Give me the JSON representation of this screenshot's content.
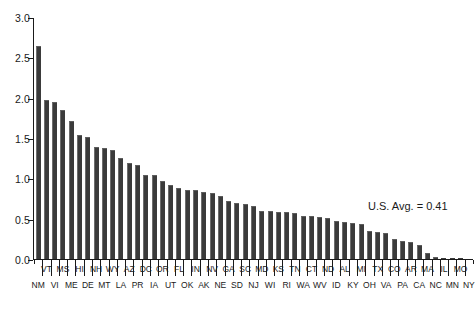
{
  "chart_data": {
    "type": "bar",
    "title": "",
    "subtitle": "",
    "xlabel": "",
    "ylabel": "",
    "ylim": [
      0.0,
      3.0
    ],
    "ytick_values": [
      0.0,
      0.5,
      1.0,
      1.5,
      2.0,
      2.5,
      3.0
    ],
    "ytick_labels": [
      "0.0",
      "0.5",
      "1.0",
      "1.5",
      "2.0",
      "2.5",
      "3.0"
    ],
    "grid": false,
    "legend": null,
    "legend_position": "none",
    "bar_color": "#3b3b3b",
    "axis_color": "#1a1a1a",
    "background_color": "#ffffff",
    "label_layout": "staggered-two-row",
    "categories": [
      "NM",
      "VT",
      "VI",
      "MS",
      "ME",
      "HI",
      "DE",
      "NH",
      "MT",
      "WY",
      "LA",
      "AZ",
      "PR",
      "DC",
      "IA",
      "OR",
      "UT",
      "FL",
      "OK",
      "IN",
      "AK",
      "NV",
      "NE",
      "GA",
      "SD",
      "SC",
      "NJ",
      "MD",
      "WI",
      "KS",
      "RI",
      "TN",
      "WA",
      "CT",
      "WV",
      "ND",
      "ID",
      "AL",
      "KY",
      "MI",
      "OH",
      "TX",
      "VA",
      "CO",
      "PA",
      "AR",
      "CA",
      "MA",
      "NC",
      "IL",
      "MN",
      "MO",
      "NY"
    ],
    "values": [
      2.65,
      1.98,
      1.95,
      1.85,
      1.72,
      1.54,
      1.52,
      1.4,
      1.38,
      1.36,
      1.26,
      1.2,
      1.17,
      1.05,
      1.05,
      0.97,
      0.92,
      0.89,
      0.86,
      0.86,
      0.84,
      0.82,
      0.78,
      0.72,
      0.7,
      0.68,
      0.66,
      0.6,
      0.6,
      0.59,
      0.58,
      0.57,
      0.54,
      0.53,
      0.52,
      0.51,
      0.47,
      0.46,
      0.45,
      0.43,
      0.35,
      0.34,
      0.33,
      0.25,
      0.23,
      0.21,
      0.18,
      0.07,
      0.02,
      0.01,
      0.01,
      0.01,
      0.0
    ],
    "annotations": [
      {
        "text": "U.S. Avg. = 0.41",
        "value": 0.41
      }
    ]
  },
  "annotation": {
    "us_average_label": "U.S. Avg. = 0.41"
  }
}
